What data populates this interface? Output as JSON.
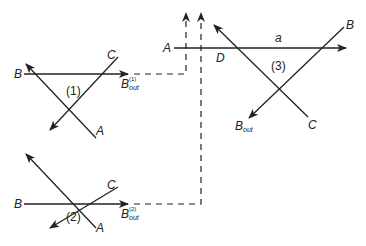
{
  "diagram": {
    "triangle_1": {
      "id_label": "(1)",
      "line_labels": {
        "B": "B",
        "C": "C",
        "A": "A"
      },
      "output": {
        "base": "B",
        "sub": "out",
        "sup": "(1)"
      }
    },
    "triangle_2": {
      "id_label": "(2)",
      "line_labels": {
        "B": "B",
        "C": "C",
        "A": "A"
      },
      "output": {
        "base": "B",
        "sub": "out",
        "sup": "(2)"
      }
    },
    "triangle_3": {
      "id_label": "(3)",
      "line_labels": {
        "A": "A",
        "B": "B",
        "C": "C",
        "D": "D",
        "a": "a"
      },
      "output": {
        "base": "B",
        "sub": "out"
      }
    },
    "colors": {
      "stroke": "#222222",
      "background": "#ffffff"
    }
  }
}
